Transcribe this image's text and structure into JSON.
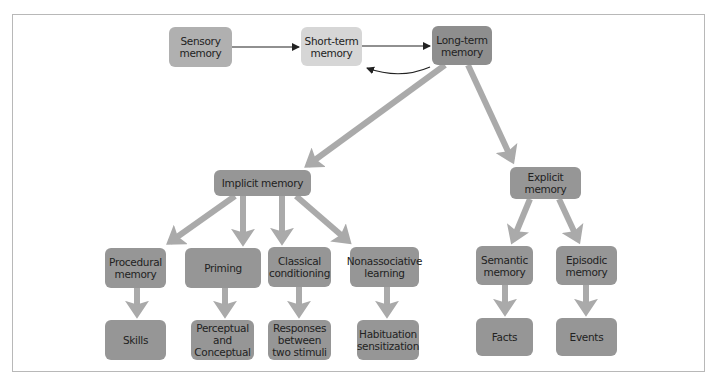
{
  "diagram": {
    "colors": {
      "box": "#969696",
      "sensory_box": "#b0b0b0",
      "short_term_box": "#d6d6d6",
      "long_term_box": "#8e8e8e",
      "thick_arrow": "#aaaaaa",
      "thin_arrow": "#222222",
      "frame": "#b8b8b8"
    },
    "nodes": {
      "sensory": "Sensory\nmemory",
      "short_term": "Short-term\nmemory",
      "long_term": "Long-term\nmemory",
      "implicit": "Implicit memory",
      "explicit": "Explicit\nmemory",
      "procedural": "Procedural\nmemory",
      "priming": "Priming",
      "classical": "Classical\nconditioning",
      "nonassociative": "Nonassociative\nlearning",
      "semantic": "Semantic\nmemory",
      "episodic": "Episodic\nmemory",
      "skills": "Skills",
      "perceptual": "Perceptual\nand\nConceptual",
      "responses": "Responses\nbetween\ntwo stimuli",
      "habituation": "Habituation\nsensitization",
      "facts": "Facts",
      "events": "Events"
    },
    "edges": [
      {
        "from": "sensory",
        "to": "short_term",
        "style": "thin"
      },
      {
        "from": "short_term",
        "to": "long_term",
        "style": "thin"
      },
      {
        "from": "long_term",
        "to": "short_term",
        "style": "thin-curved"
      },
      {
        "from": "long_term",
        "to": "implicit",
        "style": "thick"
      },
      {
        "from": "long_term",
        "to": "explicit",
        "style": "thick"
      },
      {
        "from": "implicit",
        "to": "procedural",
        "style": "thick"
      },
      {
        "from": "implicit",
        "to": "priming",
        "style": "thick"
      },
      {
        "from": "implicit",
        "to": "classical",
        "style": "thick"
      },
      {
        "from": "implicit",
        "to": "nonassociative",
        "style": "thick"
      },
      {
        "from": "explicit",
        "to": "semantic",
        "style": "thick"
      },
      {
        "from": "explicit",
        "to": "episodic",
        "style": "thick"
      },
      {
        "from": "procedural",
        "to": "skills",
        "style": "thick"
      },
      {
        "from": "priming",
        "to": "perceptual",
        "style": "thick"
      },
      {
        "from": "classical",
        "to": "responses",
        "style": "thick"
      },
      {
        "from": "nonassociative",
        "to": "habituation",
        "style": "thick"
      },
      {
        "from": "semantic",
        "to": "facts",
        "style": "thick"
      },
      {
        "from": "episodic",
        "to": "events",
        "style": "thick"
      }
    ]
  }
}
